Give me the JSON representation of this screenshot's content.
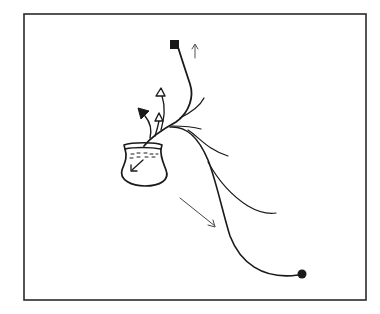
{
  "figure": {
    "type": "line-drawing",
    "background": "#ffffff",
    "stroke_color": "#1a1a1a",
    "frame": {
      "x": 24,
      "y": 14,
      "width": 342,
      "height": 286
    },
    "elements": {
      "vessel": {
        "label": "pot",
        "x": 121,
        "y": 143,
        "width": 46,
        "height": 42
      },
      "start_marker": {
        "shape": "filled-square",
        "x": 175,
        "y": 44
      },
      "end_marker": {
        "shape": "filled-circle",
        "x": 302,
        "y": 274
      },
      "up_arrow": {
        "direction": "up",
        "x": 195,
        "y": 44
      },
      "diagonal_arrow": {
        "direction": "down-right",
        "from": [
          180,
          198
        ],
        "to": [
          215,
          227
        ]
      },
      "open_triangle_upper": {
        "shape": "open-triangle",
        "x": 160,
        "y": 92
      },
      "open_triangle_lower": {
        "shape": "open-triangle",
        "x": 159,
        "y": 117
      },
      "filled_triangle": {
        "shape": "filled-triangle",
        "x": 143,
        "y": 112
      },
      "inner_arrow": {
        "direction": "down-left",
        "location": "inside vessel"
      }
    }
  }
}
